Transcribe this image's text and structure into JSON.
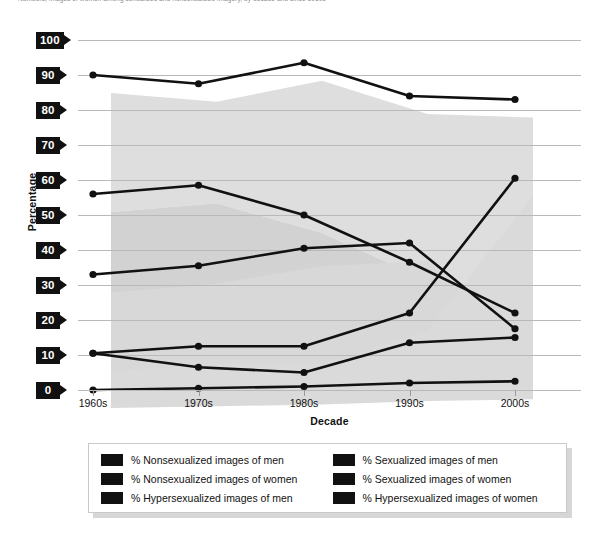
{
  "caption": {
    "text": "Numbers, images of women among sexualized and nonsexualized imagery, by decade and since 1960s"
  },
  "chart_data": {
    "type": "line",
    "title": "",
    "xlabel": "Decade",
    "ylabel": "Percentage",
    "categories": [
      "1960s",
      "1970s",
      "1980s",
      "1990s",
      "2000s"
    ],
    "ylim": [
      0,
      100
    ],
    "yticks": [
      0,
      10,
      20,
      30,
      40,
      50,
      60,
      70,
      80,
      90,
      100
    ],
    "grid": true,
    "legend_position": "bottom",
    "series": [
      {
        "name": "% Nonsexualized images of men",
        "color": "#111111",
        "values": [
          90,
          87.5,
          93.5,
          84,
          83
        ]
      },
      {
        "name": "% Sexualized images of men",
        "color": "#111111",
        "values": [
          10.5,
          6.5,
          5,
          13.5,
          15
        ]
      },
      {
        "name": "% Nonsexualized images of women",
        "color": "#111111",
        "values": [
          56,
          58.5,
          50,
          36.5,
          22
        ]
      },
      {
        "name": "% Sexualized images of women",
        "color": "#111111",
        "values": [
          33,
          35.5,
          40.5,
          42,
          17.5
        ]
      },
      {
        "name": "% Hypersexualized images of men",
        "color": "#111111",
        "values": [
          0,
          0.5,
          1,
          2,
          2.5
        ]
      },
      {
        "name": "% Hypersexualized images of women",
        "color": "#111111",
        "values": [
          10.5,
          12.5,
          12.5,
          22,
          60.5
        ]
      }
    ]
  },
  "legend": {
    "entries": [
      "% Nonsexualized images of men",
      "% Sexualized images of men",
      "% Nonsexualized images of women",
      "% Sexualized images of women",
      "% Hypersexualized images of men",
      "% Hypersexualized images of women"
    ]
  }
}
